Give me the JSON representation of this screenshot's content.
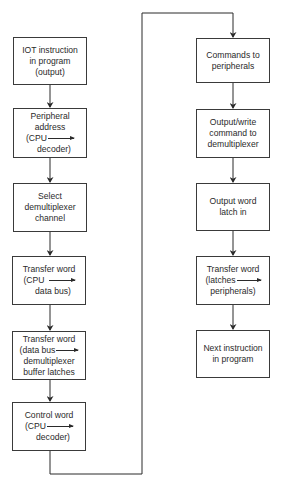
{
  "diagram": {
    "type": "flowchart",
    "title": "",
    "line_color": "#2a2a2a",
    "left_column": [
      {
        "id": "L1",
        "lines": [
          "IOT instruction",
          "in program",
          "(output)"
        ]
      },
      {
        "id": "L2",
        "lines": [
          "Peripheral",
          "address",
          "(CPU",
          "decoder)"
        ],
        "inline_arrow_after": "(CPU"
      },
      {
        "id": "L3",
        "lines": [
          "Select",
          "demultiplexer",
          "channel"
        ]
      },
      {
        "id": "L4",
        "lines": [
          "Transfer word",
          "(CPU",
          "data bus)"
        ],
        "inline_arrow_after": "(CPU"
      },
      {
        "id": "L5",
        "lines": [
          "Transfer word",
          "(data bus",
          "demultiplexer",
          "buffer latches"
        ],
        "inline_arrow_after": "(data bus"
      },
      {
        "id": "L6",
        "lines": [
          "Control word",
          "(CPU",
          "decoder)"
        ],
        "inline_arrow_after": "(CPU"
      }
    ],
    "right_column": [
      {
        "id": "R1",
        "lines": [
          "Commands to",
          "peripherals"
        ]
      },
      {
        "id": "R2",
        "lines": [
          "Output/write",
          "command to",
          "demultiplexer"
        ]
      },
      {
        "id": "R3",
        "lines": [
          "Output word",
          "latch in"
        ]
      },
      {
        "id": "R4",
        "lines": [
          "Transfer word",
          "(latches",
          "peripherals)"
        ],
        "inline_arrow_after": "(latches"
      },
      {
        "id": "R5",
        "lines": [
          "Next instruction",
          "in program"
        ]
      }
    ],
    "edges": [
      [
        "L1",
        "L2"
      ],
      [
        "L2",
        "L3"
      ],
      [
        "L3",
        "L4"
      ],
      [
        "L4",
        "L5"
      ],
      [
        "L5",
        "L6"
      ],
      [
        "L6",
        "R1"
      ],
      [
        "R1",
        "R2"
      ],
      [
        "R2",
        "R3"
      ],
      [
        "R3",
        "R4"
      ],
      [
        "R4",
        "R5"
      ]
    ]
  }
}
